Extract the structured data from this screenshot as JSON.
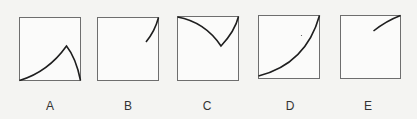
{
  "figure": {
    "panels": [
      {
        "label": "A",
        "description": "curve rising from bottom-left to a peak then falling to bottom-right"
      },
      {
        "label": "B",
        "description": "short curve near top-right corner"
      },
      {
        "label": "C",
        "description": "curve from top-left down to a cusp then up to top-right"
      },
      {
        "label": "D",
        "description": "curve rising from bottom-left to top-right, concave up"
      },
      {
        "label": "E",
        "description": "short curve rising to top-right corner"
      }
    ],
    "colors": {
      "frame": "#6e6e6e",
      "curve": "#1e1e1e",
      "background": "#f4f4f2",
      "label": "#333333"
    }
  }
}
